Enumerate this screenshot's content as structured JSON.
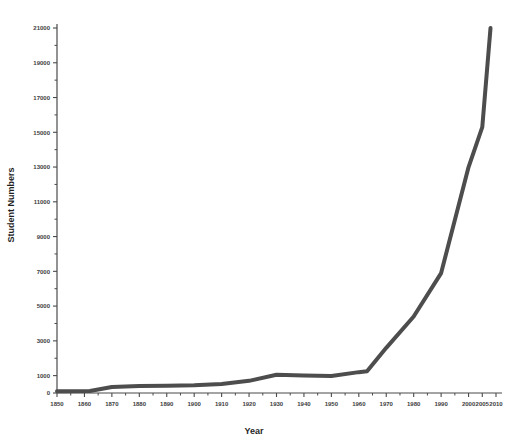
{
  "chart_data": {
    "type": "line",
    "title": "",
    "xlabel": "Year",
    "ylabel": "Student Numbers",
    "xlim": [
      1850,
      2010
    ],
    "ylim": [
      0,
      21000
    ],
    "grid": false,
    "legend": "none",
    "y_ticks": [
      0,
      1000,
      3000,
      5000,
      7000,
      9000,
      11000,
      13000,
      15000,
      17000,
      19000,
      21000
    ],
    "y_tick_labels": [
      "0",
      "1000",
      "3000",
      "5000",
      "7000",
      "9000",
      "11000",
      "13000",
      "15000",
      "17000",
      "19000",
      "21000"
    ],
    "y_minor_ticks": [
      2000,
      4000,
      6000,
      8000,
      10000,
      12000,
      14000,
      16000,
      18000,
      20000
    ],
    "x_ticks": [
      1850,
      1860,
      1870,
      1880,
      1890,
      1900,
      1910,
      1920,
      1930,
      1940,
      1950,
      1960,
      1970,
      1980,
      1990,
      2000,
      2005,
      2010
    ],
    "x_tick_labels": [
      "1850",
      "1860",
      "1870",
      "1880",
      "1890",
      "1900",
      "1910",
      "1920",
      "1930",
      "1940",
      "1950",
      "1960",
      "1970",
      "1980",
      "1990",
      "2000",
      "2005",
      "2010"
    ],
    "x_minor_ticks": [
      1855,
      1865,
      1875,
      1885,
      1895,
      1905,
      1915,
      1925,
      1935,
      1945,
      1955,
      1965,
      1975,
      1985,
      1995
    ],
    "series": [
      {
        "name": "Student Numbers",
        "color": "#4d4d4d",
        "x": [
          1850,
          1862,
          1870,
          1880,
          1890,
          1900,
          1910,
          1920,
          1930,
          1940,
          1950,
          1960,
          1963,
          1970,
          1980,
          1990,
          2000,
          2005,
          2008
        ],
        "values": [
          100,
          120,
          350,
          400,
          420,
          450,
          520,
          700,
          1050,
          1000,
          980,
          1200,
          1250,
          2600,
          4400,
          6900,
          13000,
          15300,
          21000
        ]
      }
    ]
  },
  "axes": {
    "x_title": "Year",
    "y_title": "Student Numbers"
  },
  "colors": {
    "line": "#4d4d4d",
    "axis": "#4a4a4a",
    "text": "#1f1f1f",
    "background": "#ffffff"
  }
}
